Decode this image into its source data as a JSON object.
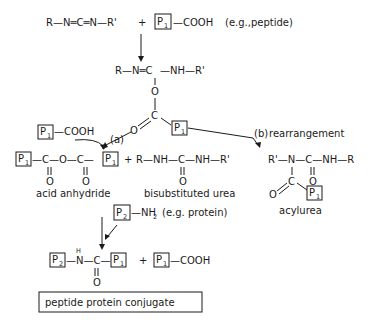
{
  "reactants": {
    "carbodiimide": "R—N═C═N—R'",
    "plus": "+",
    "peptide_box": "P",
    "peptide_sub": "1",
    "peptide_group": "—COOH",
    "peptide_note": "(e.g.,peptide)"
  },
  "intermediate": {
    "left": "R—N═C",
    "right": "—NH—R'",
    "oxygen": "O",
    "carbon": "C",
    "carbonyl_o": "O",
    "box": "P",
    "sub": "1"
  },
  "path_a": {
    "label": "(a)",
    "reagent_box": "P",
    "reagent_sub": "1",
    "reagent_group": "—COOH"
  },
  "path_b": {
    "label": "(b)",
    "text": "rearrangement"
  },
  "anhydride": {
    "box_left": "P",
    "sub_left": "1",
    "chain": "—C—O—C—",
    "box_right": "P",
    "sub_right": "1",
    "o1": "O",
    "o2": "O",
    "label": "acid anhydride"
  },
  "urea": {
    "plus": "+",
    "chain": "R—NH—C—NH—R'",
    "o": "O",
    "label": "bisubstituted urea"
  },
  "acylurea": {
    "chain": "R'—N—C—NH—R",
    "o_right": "O",
    "c": "C",
    "o_left": "O",
    "box": "P",
    "sub": "1",
    "label": "acylurea"
  },
  "protein_reagent": {
    "box": "P",
    "sub": "2",
    "group": "—NH",
    "group_sub": "2",
    "note": "(e.g. protein)"
  },
  "product": {
    "box_left": "P",
    "sub_left": "2",
    "h": "H",
    "chain": "—N—C—",
    "box_right": "P",
    "sub_right": "1",
    "o": "O",
    "plus": "+",
    "byproduct_box": "P",
    "byproduct_sub": "1",
    "byproduct_group": "—COOH"
  },
  "result_label": "peptide protein conjugate"
}
